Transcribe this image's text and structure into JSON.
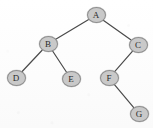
{
  "figure": {
    "kind": "binary-tree-diagram",
    "width": 153,
    "height": 128,
    "background_color": "#fdfdfd"
  },
  "style": {
    "node_fill": "#c9c9c9",
    "node_stroke": "#8e8e8e",
    "label_color": "#2b2b2b",
    "edge_color": "#4a4a4a",
    "edge_width": 1.2,
    "node_rx": 9.5,
    "node_ry": 8
  },
  "chart_data": {
    "type": "diagram",
    "title": "",
    "nodes": [
      {
        "id": "A",
        "label": "A",
        "x": 96,
        "y": 15,
        "depth": 0
      },
      {
        "id": "B",
        "label": "B",
        "x": 48,
        "y": 44,
        "depth": 1
      },
      {
        "id": "C",
        "label": "C",
        "x": 138,
        "y": 45,
        "depth": 1
      },
      {
        "id": "D",
        "label": "D",
        "x": 16,
        "y": 78,
        "depth": 2
      },
      {
        "id": "E",
        "label": "E",
        "x": 71,
        "y": 79,
        "depth": 2
      },
      {
        "id": "F",
        "label": "F",
        "x": 109,
        "y": 78,
        "depth": 2
      },
      {
        "id": "G",
        "label": "G",
        "x": 139,
        "y": 114,
        "depth": 3
      }
    ],
    "edges": [
      {
        "from": "A",
        "to": "B",
        "side": "left"
      },
      {
        "from": "A",
        "to": "C",
        "side": "right"
      },
      {
        "from": "B",
        "to": "D",
        "side": "left"
      },
      {
        "from": "B",
        "to": "E",
        "side": "right"
      },
      {
        "from": "C",
        "to": "F",
        "side": "left"
      },
      {
        "from": "F",
        "to": "G",
        "side": "right"
      }
    ]
  }
}
